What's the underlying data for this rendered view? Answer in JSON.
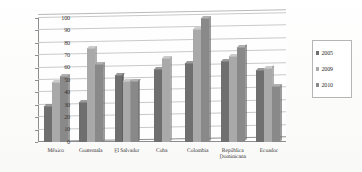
{
  "chart_data": {
    "type": "bar",
    "title": "",
    "subtitle": "",
    "xlabel": "",
    "ylabel": "",
    "ylim": [
      0,
      100
    ],
    "yticks": [
      0,
      10,
      20,
      30,
      40,
      50,
      60,
      70,
      80,
      90,
      100
    ],
    "grid": true,
    "legend_position": "right",
    "categories": [
      "México",
      "Guatemala",
      "El Salvador",
      "Cuba",
      "Colombia",
      "República Dominicana",
      "Ecuador"
    ],
    "category_lines": [
      [
        "México"
      ],
      [
        "Guatemala"
      ],
      [
        "El Salvador"
      ],
      [
        "Cuba"
      ],
      [
        "Colombia"
      ],
      [
        "República",
        "Dominicana"
      ],
      [
        "Ecuador"
      ]
    ],
    "series": [
      {
        "name": "2005",
        "color": "#6f6f6f",
        "values": [
          29,
          32,
          54,
          59,
          64,
          65,
          58
        ]
      },
      {
        "name": "2009",
        "color": "#a9a9a9",
        "values": [
          48,
          76,
          49,
          68,
          91,
          69,
          60
        ]
      },
      {
        "name": "2010",
        "color": "#898989",
        "values": [
          53,
          63,
          49,
          null,
          100,
          77,
          45
        ]
      }
    ]
  },
  "legend": {
    "items": [
      {
        "label": "2005",
        "color": "#6f6f6f"
      },
      {
        "label": "2009",
        "color": "#a9a9a9"
      },
      {
        "label": "2010",
        "color": "#898989"
      }
    ]
  }
}
